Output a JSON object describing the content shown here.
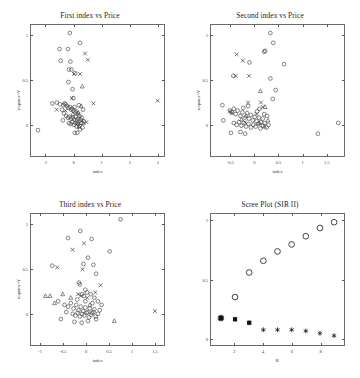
{
  "figure": {
    "background": "#ffffff",
    "frame_color": "#6b6b6b",
    "marker_color": "#3a3a3a"
  },
  "chart_data": [
    {
      "type": "scatter",
      "panel": "top-left",
      "title": "First index vs Price",
      "xlabel": "index",
      "ylabel": "response=Y",
      "xlim": [
        -1.55,
        3.25
      ],
      "ylim": [
        -0.35,
        1.12
      ],
      "xticks": [
        -1,
        0,
        1,
        2,
        3
      ],
      "yticks": [
        0,
        0.5,
        1
      ],
      "ytick_labels": [
        "0",
        "0.5",
        "1"
      ],
      "grid": false,
      "legend": "none",
      "series": [
        {
          "name": "group-circle",
          "marker": "circle",
          "points": [
            [
              -0.15,
              1.03
            ],
            [
              0.22,
              0.92
            ],
            [
              -0.52,
              0.85
            ],
            [
              -0.22,
              0.85
            ],
            [
              -0.48,
              0.72
            ],
            [
              -0.13,
              0.71
            ],
            [
              -0.18,
              0.62
            ],
            [
              -0.09,
              0.62
            ],
            [
              0.04,
              0.58
            ],
            [
              -0.2,
              0.48
            ],
            [
              -0.05,
              0.4
            ],
            [
              -0.62,
              0.25
            ],
            [
              -0.5,
              0.23
            ],
            [
              -0.38,
              0.22
            ],
            [
              -0.34,
              0.24
            ],
            [
              -0.3,
              0.23
            ],
            [
              -0.43,
              0.17
            ],
            [
              -0.36,
              0.13
            ],
            [
              -0.25,
              0.21
            ],
            [
              -0.2,
              0.19
            ],
            [
              -0.14,
              0.2
            ],
            [
              -0.1,
              0.17
            ],
            [
              -0.06,
              0.18
            ],
            [
              -0.02,
              0.16
            ],
            [
              0.02,
              0.2
            ],
            [
              0.06,
              0.14
            ],
            [
              0.1,
              0.15
            ],
            [
              0.14,
              0.13
            ],
            [
              -0.28,
              0.1
            ],
            [
              -0.22,
              0.08
            ],
            [
              -0.16,
              0.09
            ],
            [
              -0.1,
              0.07
            ],
            [
              -0.04,
              0.08
            ],
            [
              0.01,
              0.06
            ],
            [
              0.06,
              0.09
            ],
            [
              0.11,
              0.05
            ],
            [
              0.16,
              0.07
            ],
            [
              0.2,
              0.1
            ],
            [
              0.24,
              0.06
            ],
            [
              0.28,
              0.08
            ],
            [
              -0.18,
              0.02
            ],
            [
              -0.12,
              0.01
            ],
            [
              -0.06,
              0.03
            ],
            [
              0.0,
              0.0
            ],
            [
              0.05,
              0.02
            ],
            [
              0.1,
              -0.02
            ],
            [
              0.15,
              0.01
            ],
            [
              0.2,
              -0.01
            ],
            [
              0.26,
              0.02
            ],
            [
              0.31,
              -0.03
            ],
            [
              0.03,
              -0.09
            ],
            [
              0.12,
              -0.09
            ],
            [
              -1.3,
              -0.06
            ],
            [
              -0.78,
              0.24
            ],
            [
              0.36,
              0.04
            ],
            [
              0.33,
              0.17
            ],
            [
              -0.02,
              0.3
            ],
            [
              0.18,
              0.22
            ],
            [
              -0.4,
              0.05
            ],
            [
              0.22,
              -0.05
            ]
          ]
        },
        {
          "name": "group-cross",
          "marker": "cross",
          "points": [
            [
              0.4,
              0.8
            ],
            [
              0.5,
              0.73
            ],
            [
              0.0,
              0.57
            ],
            [
              0.22,
              0.57
            ],
            [
              -0.08,
              0.3
            ],
            [
              0.7,
              0.24
            ],
            [
              3.02,
              0.27
            ],
            [
              -0.62,
              0.17
            ],
            [
              0.28,
              0.04
            ],
            [
              0.45,
              0.03
            ],
            [
              0.16,
              0.12
            ],
            [
              -0.3,
              0.16
            ]
          ]
        },
        {
          "name": "group-triangle",
          "marker": "triangle",
          "points": [
            [
              0.3,
              0.43
            ],
            [
              0.26,
              0.21
            ],
            [
              0.34,
              0.02
            ],
            [
              -0.04,
              0.12
            ],
            [
              0.12,
              0.03
            ],
            [
              0.18,
              -0.02
            ]
          ]
        }
      ]
    },
    {
      "type": "scatter",
      "panel": "top-right",
      "title": "Second index vs Price",
      "xlabel": "index",
      "ylabel": "response=Y",
      "xlim": [
        -0.92,
        1.88
      ],
      "ylim": [
        -0.35,
        1.12
      ],
      "xticks": [
        -0.5,
        0,
        0.5,
        1,
        1.5
      ],
      "yticks": [
        0,
        0.5,
        1
      ],
      "ytick_labels": [
        "0",
        "0.5",
        "1"
      ],
      "grid": false,
      "legend": "none",
      "series": [
        {
          "name": "group-circle",
          "marker": "circle",
          "points": [
            [
              0.33,
              1.03
            ],
            [
              0.39,
              0.92
            ],
            [
              0.2,
              0.82
            ],
            [
              0.22,
              0.83
            ],
            [
              -0.11,
              0.7
            ],
            [
              0.62,
              0.68
            ],
            [
              -0.45,
              0.55
            ],
            [
              0.33,
              0.52
            ],
            [
              0.44,
              0.39
            ],
            [
              0.38,
              0.29
            ],
            [
              -0.68,
              0.22
            ],
            [
              -0.52,
              0.16
            ],
            [
              -0.48,
              0.14
            ],
            [
              -0.44,
              0.18
            ],
            [
              -0.4,
              0.12
            ],
            [
              -0.36,
              0.16
            ],
            [
              -0.3,
              0.1
            ],
            [
              -0.26,
              0.14
            ],
            [
              -0.21,
              0.08
            ],
            [
              -0.16,
              0.13
            ],
            [
              -0.12,
              0.07
            ],
            [
              -0.08,
              0.11
            ],
            [
              -0.04,
              0.05
            ],
            [
              0.0,
              0.09
            ],
            [
              0.04,
              0.04
            ],
            [
              0.09,
              0.08
            ],
            [
              0.13,
              0.03
            ],
            [
              0.17,
              0.07
            ],
            [
              -0.44,
              0.02
            ],
            [
              -0.38,
              0.0
            ],
            [
              -0.33,
              0.03
            ],
            [
              -0.28,
              -0.01
            ],
            [
              -0.23,
              0.02
            ],
            [
              -0.18,
              -0.02
            ],
            [
              -0.13,
              0.01
            ],
            [
              -0.08,
              -0.03
            ],
            [
              -0.03,
              0.0
            ],
            [
              0.02,
              -0.02
            ],
            [
              0.07,
              0.01
            ],
            [
              0.12,
              -0.04
            ],
            [
              0.17,
              -0.01
            ],
            [
              0.21,
              0.02
            ],
            [
              0.25,
              -0.03
            ],
            [
              0.29,
              0.0
            ],
            [
              -0.5,
              -0.09
            ],
            [
              -0.3,
              -0.08
            ],
            [
              -0.2,
              -0.1
            ],
            [
              1.33,
              -0.1
            ],
            [
              1.76,
              0.02
            ],
            [
              -0.66,
              0.05
            ],
            [
              0.05,
              0.15
            ],
            [
              0.2,
              0.12
            ],
            [
              -0.24,
              0.19
            ],
            [
              0.1,
              0.18
            ],
            [
              -0.14,
              0.21
            ],
            [
              0.26,
              0.1
            ]
          ]
        },
        {
          "name": "group-cross",
          "marker": "cross",
          "points": [
            [
              -0.38,
              0.79
            ],
            [
              -0.25,
              0.72
            ],
            [
              -0.4,
              0.55
            ],
            [
              -0.12,
              0.55
            ],
            [
              -0.14,
              0.25
            ],
            [
              0.13,
              0.25
            ],
            [
              -0.52,
              0.15
            ],
            [
              -0.48,
              0.13
            ],
            [
              0.04,
              0.12
            ],
            [
              -0.2,
              0.03
            ],
            [
              0.17,
              0.2
            ]
          ]
        },
        {
          "name": "group-triangle",
          "marker": "triangle",
          "points": [
            [
              0.12,
              0.38
            ],
            [
              0.22,
              0.2
            ],
            [
              -0.18,
              0.1
            ],
            [
              0.28,
              0.05
            ],
            [
              0.2,
              -0.02
            ],
            [
              0.1,
              0.02
            ],
            [
              -0.28,
              0.06
            ]
          ]
        }
      ]
    },
    {
      "type": "scatter",
      "panel": "bottom-left",
      "title": "Third index vs Price",
      "xlabel": "index",
      "ylabel": "response=Y",
      "xlim": [
        -1.22,
        1.72
      ],
      "ylim": [
        -0.35,
        1.12
      ],
      "xticks": [
        -1,
        -0.5,
        0,
        0.5,
        1,
        1.5
      ],
      "yticks": [
        0,
        0.5,
        1
      ],
      "ytick_labels": [
        "0",
        "0.5",
        "1"
      ],
      "grid": false,
      "legend": "none",
      "series": [
        {
          "name": "group-circle",
          "marker": "circle",
          "points": [
            [
              0.76,
              1.06
            ],
            [
              -0.13,
              0.93
            ],
            [
              -0.4,
              0.85
            ],
            [
              0.12,
              0.84
            ],
            [
              0.04,
              0.63
            ],
            [
              0.52,
              0.7
            ],
            [
              -0.06,
              0.56
            ],
            [
              0.16,
              0.55
            ],
            [
              -0.75,
              0.54
            ],
            [
              0.22,
              0.45
            ],
            [
              -0.16,
              0.35
            ],
            [
              -0.14,
              0.33
            ],
            [
              -0.02,
              0.27
            ],
            [
              0.1,
              0.22
            ],
            [
              -0.09,
              0.22
            ],
            [
              -0.05,
              0.2
            ],
            [
              0.02,
              0.24
            ],
            [
              0.18,
              0.18
            ],
            [
              -0.62,
              0.14
            ],
            [
              -0.48,
              0.1
            ],
            [
              -0.4,
              0.08
            ],
            [
              -0.34,
              0.12
            ],
            [
              -0.28,
              0.06
            ],
            [
              -0.22,
              0.1
            ],
            [
              -0.17,
              0.04
            ],
            [
              -0.12,
              0.08
            ],
            [
              -0.07,
              0.03
            ],
            [
              -0.02,
              0.07
            ],
            [
              0.03,
              0.02
            ],
            [
              0.08,
              0.06
            ],
            [
              0.13,
              0.01
            ],
            [
              0.18,
              0.05
            ],
            [
              -0.3,
              0.0
            ],
            [
              -0.24,
              -0.02
            ],
            [
              -0.19,
              0.01
            ],
            [
              -0.14,
              -0.03
            ],
            [
              -0.09,
              0.0
            ],
            [
              -0.04,
              -0.02
            ],
            [
              0.01,
              0.01
            ],
            [
              0.06,
              -0.04
            ],
            [
              0.11,
              -0.01
            ],
            [
              0.16,
              0.02
            ],
            [
              0.21,
              -0.03
            ],
            [
              0.26,
              0.0
            ],
            [
              -0.56,
              -0.06
            ],
            [
              -0.26,
              -0.09
            ],
            [
              -0.1,
              -0.1
            ],
            [
              0.04,
              -0.08
            ],
            [
              0.22,
              -0.06
            ],
            [
              0.3,
              0.04
            ],
            [
              0.34,
              0.1
            ],
            [
              -0.44,
              0.02
            ],
            [
              0.26,
              0.14
            ],
            [
              -0.2,
              0.16
            ],
            [
              0.14,
              0.12
            ],
            [
              -0.02,
              0.14
            ]
          ]
        },
        {
          "name": "group-cross",
          "marker": "cross",
          "points": [
            [
              -0.05,
              0.79
            ],
            [
              -0.3,
              0.72
            ],
            [
              -0.64,
              0.52
            ],
            [
              -0.08,
              0.5
            ],
            [
              0.32,
              0.32
            ],
            [
              -0.18,
              0.22
            ],
            [
              0.2,
              0.24
            ],
            [
              1.52,
              0.03
            ],
            [
              -0.12,
              0.2
            ],
            [
              0.02,
              0.18
            ]
          ]
        },
        {
          "name": "group-triangle",
          "marker": "triangle",
          "points": [
            [
              -0.9,
              0.2
            ],
            [
              -0.8,
              0.2
            ],
            [
              -0.52,
              0.22
            ],
            [
              -0.7,
              0.12
            ],
            [
              0.62,
              -0.08
            ],
            [
              -0.34,
              0.18
            ],
            [
              0.08,
              0.1
            ]
          ]
        }
      ]
    },
    {
      "type": "scatter",
      "panel": "bottom-right",
      "title": "Scree Plot (SIR II)",
      "xlabel": "K",
      "ylabel": "",
      "xlim": [
        0.3,
        9.7
      ],
      "ylim": [
        -0.06,
        1.06
      ],
      "xticks": [
        2,
        4,
        6,
        8
      ],
      "yticks": [
        0,
        0.5,
        1
      ],
      "ytick_labels": [
        "0",
        "0.5",
        "1"
      ],
      "grid": false,
      "legend": "none",
      "series": [
        {
          "name": "cumulative-proportion",
          "marker": "circle",
          "x": [
            1,
            2,
            3,
            4,
            5,
            6,
            7,
            8,
            9
          ],
          "values": [
            0.17,
            0.35,
            0.56,
            0.66,
            0.74,
            0.8,
            0.87,
            0.94,
            0.99
          ]
        },
        {
          "name": "eigenvalue",
          "marker": "star",
          "x": [
            1,
            2,
            3,
            4,
            5,
            6,
            7,
            8,
            9
          ],
          "values": [
            0.17,
            0.16,
            0.13,
            0.07,
            0.07,
            0.07,
            0.06,
            0.04,
            0.02
          ]
        },
        {
          "name": "eigenvalue-square-overlay",
          "marker": "square",
          "x": [
            1,
            2,
            3
          ],
          "values": [
            0.17,
            0.16,
            0.13
          ]
        }
      ]
    }
  ]
}
